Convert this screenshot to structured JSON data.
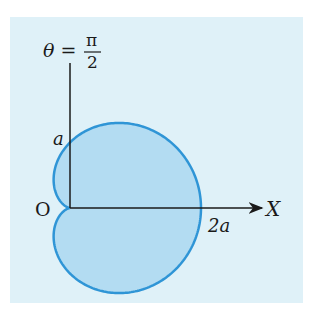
{
  "diagram": {
    "labels": {
      "theta": "θ =",
      "pi": "π",
      "two": "2",
      "a": "a",
      "origin": "O",
      "two_a": "2a",
      "x_axis": "X"
    },
    "colors": {
      "panel": "#dff1f8",
      "fill": "#b3dcf2",
      "stroke": "#2f95d6",
      "axis": "#1a1a1a"
    }
  }
}
